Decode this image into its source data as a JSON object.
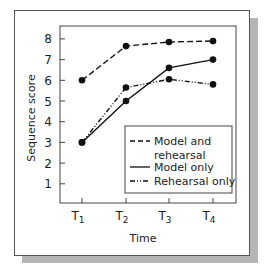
{
  "chart_data": {
    "type": "line",
    "title": "",
    "xlabel": "Time",
    "ylabel": "Sequence score",
    "categories": [
      "T1",
      "T2",
      "T3",
      "T4"
    ],
    "x_tick_labels": [
      {
        "base": "T",
        "sub": "1"
      },
      {
        "base": "T",
        "sub": "2"
      },
      {
        "base": "T",
        "sub": "3"
      },
      {
        "base": "T",
        "sub": "4"
      }
    ],
    "y_ticks": [
      1,
      2,
      3,
      4,
      5,
      6,
      7,
      8
    ],
    "ylim": [
      0,
      8.5
    ],
    "grid": false,
    "legend_position": "lower right (inside plot)",
    "series": [
      {
        "name": "Model and rehearsal",
        "style": "dashed",
        "values": [
          6.0,
          7.65,
          7.85,
          7.9
        ]
      },
      {
        "name": "Model only",
        "style": "solid",
        "values": [
          3.0,
          5.0,
          6.6,
          7.0
        ]
      },
      {
        "name": "Rehearsal only",
        "style": "dash-dot-dot",
        "values": [
          3.0,
          5.65,
          6.05,
          5.8
        ]
      }
    ]
  },
  "legend": {
    "items": [
      {
        "line1": "Model and",
        "line2": "rehearsal"
      },
      {
        "line1": "Model only"
      },
      {
        "line1": "Rehearsal only"
      }
    ]
  },
  "colors": {
    "line": "#111111",
    "axis": "#444444",
    "shadow": "#b5b5b5"
  }
}
